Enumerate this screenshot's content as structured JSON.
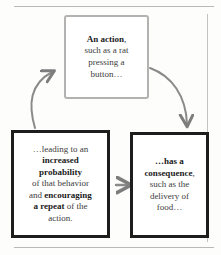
{
  "diagram": {
    "type": "cycle-flow",
    "colors": {
      "page_background": "#fdfdfc",
      "light_box_border": "#b3b2b0",
      "dark_box_border": "#1d1d1d",
      "arrow": "#7d7d7d",
      "text": "#3c3c3c",
      "bold_text": "#1b1b1b",
      "rule": "#b9b9b9"
    },
    "nodes": [
      {
        "id": "action",
        "position": "top",
        "border_style": "light-gray",
        "lines": [
          {
            "text": "An action",
            "bold": true
          },
          {
            "text": ",",
            "bold": false
          },
          {
            "text": "such as a rat",
            "bold": false
          },
          {
            "text": "pressing a",
            "bold": false
          },
          {
            "text": "button…",
            "bold": false
          }
        ],
        "plain_text": "An action, such as a rat pressing a button…"
      },
      {
        "id": "consequence",
        "position": "bottom-right",
        "border_style": "dark",
        "lines": [
          {
            "text": "…has a",
            "bold": true
          },
          {
            "text": "consequence",
            "bold": true
          },
          {
            "text": ",",
            "bold": false
          },
          {
            "text": "such as the",
            "bold": false
          },
          {
            "text": "delivery of",
            "bold": false
          },
          {
            "text": "food…",
            "bold": false
          }
        ],
        "plain_text": "…has a consequence, such as the delivery of food…"
      },
      {
        "id": "probability",
        "position": "bottom-left",
        "border_style": "dark",
        "lines": [
          {
            "text": "…leading to an",
            "bold": false
          },
          {
            "text": "increased",
            "bold": true
          },
          {
            "text": "probability",
            "bold": true
          },
          {
            "text": "of that behavior",
            "bold": false
          },
          {
            "text": "and ",
            "bold": false
          },
          {
            "text": "encouraging",
            "bold": true
          },
          {
            "text": "a repeat",
            "bold": true
          },
          {
            "text": " of the",
            "bold": false
          },
          {
            "text": "action.",
            "bold": false
          }
        ],
        "plain_text": "…leading to an increased probability of that behavior and encouraging a repeat of the action."
      }
    ],
    "arrows": [
      {
        "id": "action-to-consequence",
        "from": "action",
        "to": "consequence",
        "shape": "curved",
        "direction": "down-right"
      },
      {
        "id": "consequence-to-probability",
        "from": "consequence",
        "to": "probability",
        "shape": "straight",
        "direction": "left"
      },
      {
        "id": "probability-to-action",
        "from": "probability",
        "to": "action",
        "shape": "curved",
        "direction": "up-right"
      }
    ]
  },
  "box_action": {
    "l1_bold": "An action",
    "l1_tail": ",",
    "l2": "such as a rat",
    "l3": "pressing a",
    "l4": "button…"
  },
  "box_consequence": {
    "l1_bold": "…has a",
    "l2_bold": "consequence",
    "l2_tail": ",",
    "l3": "such as the",
    "l4": "delivery of",
    "l5": "food…"
  },
  "box_probability": {
    "l1": "…leading to an",
    "l2_bold": "increased",
    "l3_bold": "probability",
    "l4": "of that behavior",
    "l5_pre": "and ",
    "l5_bold": "encouraging",
    "l6_bold": "a repeat",
    "l6_post": " of the",
    "l7": "action."
  }
}
